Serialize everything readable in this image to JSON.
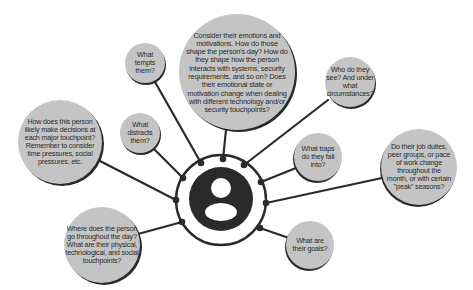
{
  "diagram": {
    "title": "",
    "colors": {
      "bubble_fill": "#c4c4c4",
      "bubble_shadow": "#2a2a2a",
      "line": "#2a2a2a",
      "hub_dark": "#2a2a2a",
      "background": "#ffffff"
    },
    "center": {
      "icon": "person-icon",
      "label": ""
    },
    "bubbles": [
      {
        "id": "emotions",
        "text": "Consider their emotions and motivations. How do those shape the person's day? How do they shape how the person interacts with systems, security requirements, and so on? Does their emotional state or motivation change when dealing with different technology and/or security touchpoints?"
      },
      {
        "id": "tempts",
        "text": "What tempts them?"
      },
      {
        "id": "distracts",
        "text": "What distracts them?"
      },
      {
        "id": "decisions",
        "text": "How does this person likely make decisions at each major touchpoint? Remember to consider time pressures, social pressures, etc."
      },
      {
        "id": "where",
        "text": "Where does the person go throughout the day? What are their physical, technological, and social touchpoints?"
      },
      {
        "id": "who",
        "text": "Who do they see? And under what circumstances?"
      },
      {
        "id": "traps",
        "text": "What traps do they fall into?"
      },
      {
        "id": "job",
        "text": "Do their job duties, peer groups, or pace of work change throughout the month, or with certain \"peak\" seasons?"
      },
      {
        "id": "goals",
        "text": "What are their goals?"
      }
    ]
  }
}
